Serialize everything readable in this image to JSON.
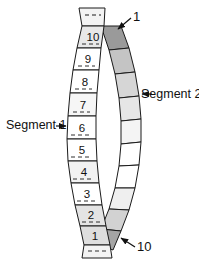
{
  "figure": {
    "title_visible": false,
    "colors": {
      "outline": "#1a1a1a",
      "white": "#ffffff",
      "light_gray": "#e2e2e2",
      "mid_gray": "#c9c9c9",
      "dark_gray": "#9a9a9a",
      "text": "#111111"
    },
    "left_strip": {
      "name": "Segment 1 strip",
      "cell_labels": [
        "10",
        "9",
        "8",
        "7",
        "6",
        "5",
        "4",
        "3",
        "2",
        "1"
      ],
      "cell_fills": [
        "#e8e8e8",
        "#ffffff",
        "#ffffff",
        "#f6f6f6",
        "#ffffff",
        "#ffffff",
        "#f2f2f2",
        "#ffffff",
        "#e4e4e4",
        "#dedede"
      ],
      "dashed_center_lines": true,
      "top_cap_dashed": true,
      "bottom_cap_dashed": true
    },
    "right_strip": {
      "name": "Segment 2 strip",
      "cell_count": 10,
      "cell_fills": [
        "#9a9a9a",
        "#c4c4c4",
        "#d6d6d6",
        "#e6e6e6",
        "#f4f4f4",
        "#ffffff",
        "#ffffff",
        "#efefef",
        "#d2d2d2",
        "#a5a5a5"
      ]
    },
    "labels": {
      "segment_1": "Segment 1",
      "segment_2": "Segment 2",
      "end_top": "1",
      "end_bottom": "10"
    },
    "annotations": {
      "segment_1_points_to_cell": "6",
      "segment_2_points_to_right_strip": true,
      "end_top_points_to": "top dark cell of right strip",
      "end_bottom_points_to": "bottom dark cell of right strip"
    }
  }
}
